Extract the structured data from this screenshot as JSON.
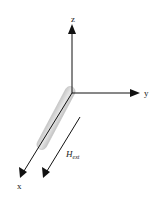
{
  "diagram": {
    "axes": {
      "z_label": "z",
      "y_label": "y",
      "x_label": "x"
    },
    "field": {
      "label_main": "H",
      "label_sub": "ext"
    },
    "colors": {
      "axis": "#111111",
      "rod_fill": "#d4d4d4",
      "rod_edge": "#bdbdbd",
      "background": "#ffffff"
    }
  }
}
